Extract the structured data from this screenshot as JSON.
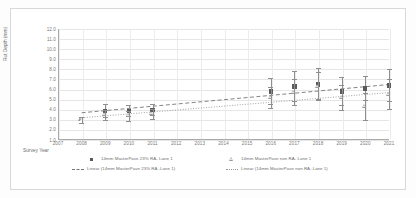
{
  "chart_data": {
    "type": "scatter",
    "title": "",
    "xlabel": "Survey Year",
    "ylabel": "Rut Depth (mm)",
    "xlim": [
      2007,
      2021
    ],
    "ylim": [
      1.0,
      12.0
    ],
    "grid": true,
    "legend_position": "bottom",
    "x_ticks": [
      "2007",
      "2008",
      "2009",
      "2010",
      "2011",
      "2012",
      "2013",
      "2014",
      "2015",
      "2016",
      "2017",
      "2018",
      "2019",
      "2020",
      "2021"
    ],
    "y_ticks": [
      "12.0",
      "11.0",
      "10.0",
      "9.0",
      "8.0",
      "7.0",
      "6.0",
      "5.0",
      "4.0",
      "3.0",
      "2.0",
      "1.0"
    ],
    "series": [
      {
        "name": "14mm MasterPave 23% RA- Lane 1",
        "marker": "square",
        "color": "#5a5a5a",
        "x": [
          2009,
          2010,
          2011,
          2016,
          2017,
          2018,
          2019,
          2020,
          2021
        ],
        "values": [
          3.9,
          3.9,
          4.0,
          5.8,
          6.3,
          6.5,
          5.8,
          6.1,
          6.4
        ],
        "err_low": [
          0.6,
          0.5,
          0.5,
          1.2,
          1.4,
          1.4,
          1.3,
          1.1,
          1.5
        ],
        "err_high": [
          0.7,
          0.6,
          0.6,
          1.3,
          1.5,
          1.6,
          1.4,
          1.2,
          1.6
        ]
      },
      {
        "name": "14mm MasterPave non RA- Lane 1",
        "marker": "triangle",
        "color": "#9a9a9a",
        "x": [
          2008,
          2009,
          2010,
          2011,
          2016,
          2017,
          2018,
          2019,
          2020,
          2021
        ],
        "values": [
          3.0,
          3.5,
          3.4,
          3.6,
          5.2,
          5.7,
          6.3,
          5.2,
          4.3,
          5.5
        ],
        "err_low": [
          0.3,
          0.5,
          0.5,
          0.5,
          1.0,
          1.2,
          1.3,
          1.2,
          1.3,
          1.4
        ],
        "err_high": [
          0.3,
          0.5,
          0.5,
          0.5,
          1.1,
          1.3,
          1.4,
          1.3,
          1.4,
          1.5
        ]
      }
    ],
    "trendlines": [
      {
        "name": "Linear (14mm MasterPave 23% RA - Lane 1)",
        "style": "dashed",
        "color": "#777777",
        "x_start": 2008,
        "y_start": 3.7,
        "x_end": 2021,
        "y_end": 6.5
      },
      {
        "name": "Linear (14mm MasterPave non RA - Lane 1)",
        "style": "dotted",
        "color": "#999999",
        "x_start": 2008,
        "y_start": 3.2,
        "x_end": 2021,
        "y_end": 5.7
      }
    ]
  },
  "legend": {
    "items": [
      {
        "label": "14mm MasterPave 23% RA- Lane 1",
        "key": "square-marker-key"
      },
      {
        "label": "14mm MasterPave non RA- Lane 1",
        "key": "triangle-marker-key"
      },
      {
        "label": "Linear (14mm MasterPave 23% RA -Lane 1)",
        "key": "dashed-line-key"
      },
      {
        "label": "Linear (14mm MasterPave non RA -Lane 1)",
        "key": "dotted-line-key"
      }
    ]
  }
}
